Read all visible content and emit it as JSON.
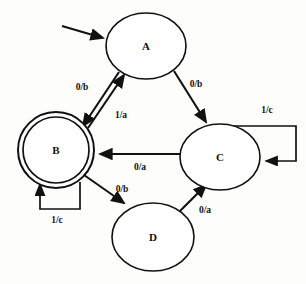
{
  "diagram": {
    "type": "finite-state-machine",
    "colors": {
      "stroke": "#111111",
      "fill": "#ffffff",
      "background": "#fdfdfc"
    },
    "states": [
      {
        "id": "A",
        "label": "A",
        "shape": "ellipse",
        "accepting": false,
        "cx": 146,
        "cy": 46,
        "rx": 40,
        "ry": 33
      },
      {
        "id": "B",
        "label": "B",
        "shape": "double-circle",
        "accepting": true,
        "cx": 56,
        "cy": 150,
        "rx": 38,
        "ry": 38
      },
      {
        "id": "C",
        "label": "C",
        "shape": "ellipse",
        "accepting": false,
        "cx": 220,
        "cy": 157,
        "rx": 40,
        "ry": 33
      },
      {
        "id": "D",
        "label": "D",
        "shape": "ellipse",
        "accepting": false,
        "cx": 153,
        "cy": 237,
        "rx": 41,
        "ry": 34
      }
    ],
    "start_state": "A",
    "transitions": [
      {
        "from": "A",
        "to": "B",
        "label": "0/b",
        "label_x": 82,
        "label_y": 88
      },
      {
        "from": "B",
        "to": "A",
        "label": "1/a",
        "label_x": 121,
        "label_y": 116
      },
      {
        "from": "A",
        "to": "C",
        "label": "0/b",
        "label_x": 196,
        "label_y": 85
      },
      {
        "from": "C",
        "to": "C",
        "label": "1/c",
        "label_x": 267,
        "label_y": 111,
        "self_loop": true
      },
      {
        "from": "C",
        "to": "B",
        "label": "0/a",
        "label_x": 140,
        "label_y": 168
      },
      {
        "from": "B",
        "to": "B",
        "label": "1/c",
        "label_x": 57,
        "label_y": 221,
        "self_loop": true
      },
      {
        "from": "B",
        "to": "D",
        "label": "0/b",
        "label_x": 122,
        "label_y": 190
      },
      {
        "from": "D",
        "to": "C",
        "label": "0/a",
        "label_x": 205,
        "label_y": 211
      }
    ]
  }
}
